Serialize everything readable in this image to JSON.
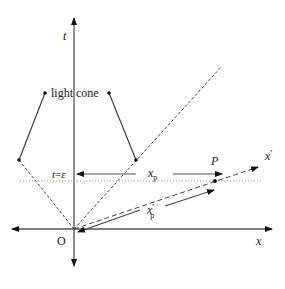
{
  "diagram": {
    "title": "",
    "labels": {
      "t_axis": "t",
      "x_axis": "x",
      "x_prime_axis": "x",
      "x_prime_mark": "′",
      "origin": "O",
      "light_cone": "light cone",
      "t_epsilon_t": "t",
      "t_epsilon_eq": "=",
      "t_epsilon_eps": "ε",
      "point_p": "P",
      "xp_base": "x",
      "xp_sub": "p",
      "xpp_base": "x",
      "xpp_sub": "p",
      "xpp_prime": "′"
    },
    "colors": {
      "axis": "#555555",
      "line": "#333333",
      "dotted": "#999999",
      "text": "#1a1a1a"
    }
  }
}
